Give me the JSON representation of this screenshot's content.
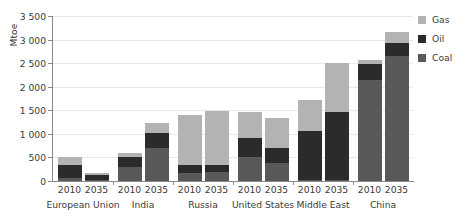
{
  "chart_data": {
    "type": "bar",
    "stacked": true,
    "title": "",
    "xlabel": "",
    "ylabel": "Mtoe",
    "ylim": [
      0,
      3500
    ],
    "ytick_step": 500,
    "ytick_labels": [
      "0",
      "500",
      "1 000",
      "1 500",
      "2 000",
      "2 500",
      "3 000",
      "3 500"
    ],
    "ytick_values": [
      0,
      500,
      1000,
      1500,
      2000,
      2500,
      3000,
      3500
    ],
    "grid": true,
    "legend_position": "right",
    "series": [
      {
        "name": "Coal",
        "color": "#595959",
        "values": [
          65,
          30,
          300,
          700,
          180,
          190,
          500,
          380,
          15,
          25,
          2150,
          2650
        ]
      },
      {
        "name": "Oil",
        "color": "#2b2b2b",
        "values": [
          270,
          90,
          210,
          310,
          170,
          160,
          420,
          330,
          1050,
          1440,
          330,
          270
        ]
      },
      {
        "name": "Gas",
        "color": "#b3b3b3",
        "values": [
          175,
          55,
          85,
          230,
          1040,
          1130,
          550,
          630,
          650,
          1030,
          80,
          250
        ]
      }
    ],
    "groups": [
      {
        "label": "European Union",
        "years": [
          "2010",
          "2035"
        ]
      },
      {
        "label": "India",
        "years": [
          "2010",
          "2035"
        ]
      },
      {
        "label": "Russia",
        "years": [
          "2010",
          "2035"
        ]
      },
      {
        "label": "United States",
        "years": [
          "2010",
          "2035"
        ]
      },
      {
        "label": "Middle East",
        "years": [
          "2010",
          "2035"
        ]
      },
      {
        "label": "China",
        "years": [
          "2010",
          "2035"
        ]
      }
    ],
    "bars": [
      {
        "group": "European Union",
        "year": "2010",
        "coal": 65,
        "oil": 270,
        "gas": 175,
        "total": 510
      },
      {
        "group": "European Union",
        "year": "2035",
        "coal": 30,
        "oil": 90,
        "gas": 55,
        "total": 175
      },
      {
        "group": "India",
        "year": "2010",
        "coal": 300,
        "oil": 210,
        "gas": 85,
        "total": 595
      },
      {
        "group": "India",
        "year": "2035",
        "coal": 700,
        "oil": 310,
        "gas": 230,
        "total": 1240
      },
      {
        "group": "Russia",
        "year": "2010",
        "coal": 180,
        "oil": 170,
        "gas": 1040,
        "total": 1390
      },
      {
        "group": "Russia",
        "year": "2035",
        "coal": 190,
        "oil": 160,
        "gas": 1130,
        "total": 1480
      },
      {
        "group": "United States",
        "year": "2010",
        "coal": 500,
        "oil": 420,
        "gas": 550,
        "total": 1470
      },
      {
        "group": "United States",
        "year": "2035",
        "coal": 380,
        "oil": 330,
        "gas": 630,
        "total": 1340
      },
      {
        "group": "Middle East",
        "year": "2010",
        "coal": 15,
        "oil": 1050,
        "gas": 650,
        "total": 1715
      },
      {
        "group": "Middle East",
        "year": "2035",
        "coal": 25,
        "oil": 1440,
        "gas": 1030,
        "total": 2495
      },
      {
        "group": "China",
        "year": "2010",
        "coal": 2150,
        "oil": 330,
        "gas": 80,
        "total": 2560
      },
      {
        "group": "China",
        "year": "2035",
        "coal": 2650,
        "oil": 270,
        "gas": 250,
        "total": 3170
      }
    ]
  },
  "axis": {
    "y_title": "Mtoe"
  },
  "legend": {
    "items": [
      {
        "label": "Gas",
        "color": "#b3b3b3"
      },
      {
        "label": "Oil",
        "color": "#2b2b2b"
      },
      {
        "label": "Coal",
        "color": "#595959"
      }
    ]
  }
}
